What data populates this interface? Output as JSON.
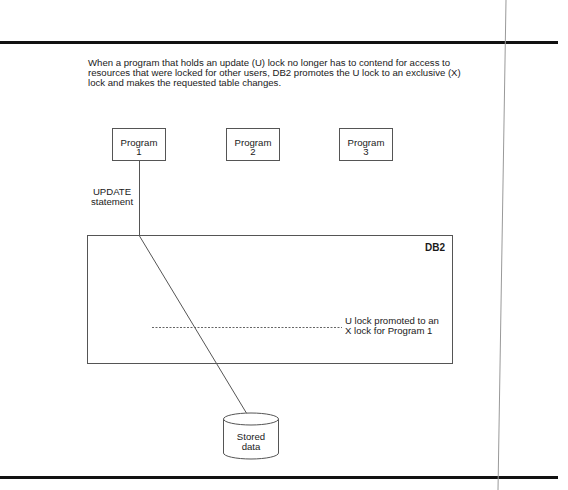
{
  "intro_text": "When a program that holds an update (U) lock no longer has to contend for access to resources that were locked for other users, DB2 promotes the U lock to an exclusive (X) lock and makes the requested table changes.",
  "programs": [
    {
      "label": "Program",
      "number": "1"
    },
    {
      "label": "Program",
      "number": "2"
    },
    {
      "label": "Program",
      "number": "3"
    }
  ],
  "update_label": {
    "line1": "UPDATE",
    "line2": "statement"
  },
  "db2_box": {
    "label": "DB2"
  },
  "promotion_note": {
    "line1": "U lock promoted to an",
    "line2": "X lock for Program 1"
  },
  "storage": {
    "line1": "Stored",
    "line2": "data"
  },
  "colors": {
    "rule": "#111111",
    "line": "#555555",
    "text": "#1a1a1a"
  }
}
